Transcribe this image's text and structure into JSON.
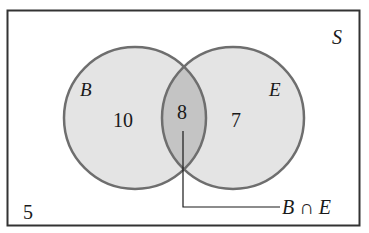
{
  "diagram": {
    "type": "venn",
    "universe": {
      "label": "S",
      "outside_count": "5"
    },
    "sets": [
      {
        "label": "B",
        "only_count": "10"
      },
      {
        "label": "E",
        "only_count": "7"
      }
    ],
    "intersection": {
      "count": "8",
      "callout_label": "B ∩ E"
    },
    "colors": {
      "frame": "#333333",
      "circle_stroke": "#6e6e6e",
      "circle_fill": "#e4e4e4",
      "intersection_fill": "#c4c4c4",
      "text": "#1a1a1a"
    }
  }
}
